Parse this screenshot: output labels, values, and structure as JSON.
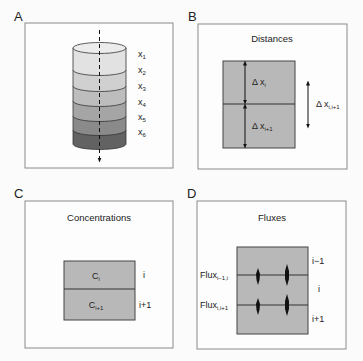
{
  "panels": {
    "A": {
      "letter": "A",
      "layers": [
        {
          "label": "x",
          "sub": "1",
          "color": "#e2e2e2"
        },
        {
          "label": "x",
          "sub": "2",
          "color": "#d0d0d0"
        },
        {
          "label": "x",
          "sub": "3",
          "color": "#bdbdbd"
        },
        {
          "label": "x",
          "sub": "4",
          "color": "#a5a5a5"
        },
        {
          "label": "x",
          "sub": "5",
          "color": "#8a8a8a"
        },
        {
          "label": "x",
          "sub": "6",
          "color": "#626262"
        }
      ]
    },
    "B": {
      "letter": "B",
      "title": "Distances",
      "delta_i": {
        "label": "Δ x",
        "sub": "i"
      },
      "delta_i1": {
        "label": "Δ x",
        "sub": "i+1"
      },
      "delta_between": {
        "label": "Δ x",
        "sub": "i,i+1"
      }
    },
    "C": {
      "letter": "C",
      "title": "Concentrations",
      "cells": [
        {
          "label": "C",
          "sub": "i",
          "index": "i"
        },
        {
          "label": "C",
          "sub": "i+1",
          "index": "i+1"
        }
      ]
    },
    "D": {
      "letter": "D",
      "title": "Fluxes",
      "flux_labels": [
        {
          "label": "Flux",
          "sub": "i−1,i"
        },
        {
          "label": "Flux",
          "sub": "i,i+1"
        }
      ],
      "indices": [
        "i−1",
        "i",
        "i+1"
      ]
    }
  },
  "colors": {
    "box_fill": "#b8b8b8",
    "border": "#555555",
    "frame": "#8a8a8a"
  }
}
